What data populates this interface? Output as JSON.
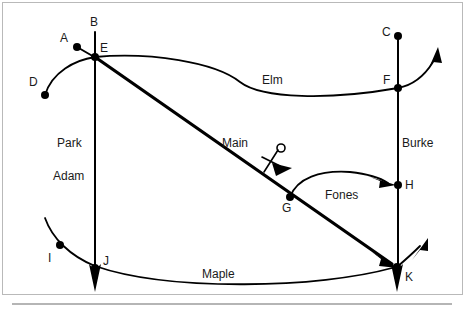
{
  "diagram": {
    "type": "street-intersection-map",
    "width": 465,
    "height": 322,
    "background_color": "#ffffff",
    "line_color": "#000000",
    "frame_color": "#b9b9b9",
    "baseline_color": "#6d6d6d"
  },
  "nodes": [
    {
      "id": "A",
      "label": "A",
      "x": 77,
      "y": 47,
      "label_x": 60,
      "label_y": 42,
      "has_dot": true
    },
    {
      "id": "B",
      "label": "B",
      "x": 95,
      "y": 28,
      "label_x": 90,
      "label_y": 26,
      "has_dot": false
    },
    {
      "id": "C",
      "label": "C",
      "x": 398,
      "y": 36,
      "label_x": 382,
      "label_y": 36,
      "has_dot": true
    },
    {
      "id": "D",
      "label": "D",
      "x": 45,
      "y": 95,
      "label_x": 29,
      "label_y": 86,
      "has_dot": true
    },
    {
      "id": "E",
      "label": "E",
      "x": 95,
      "y": 57,
      "label_x": 100,
      "label_y": 52,
      "has_dot": true
    },
    {
      "id": "F",
      "label": "F",
      "x": 398,
      "y": 88,
      "label_x": 383,
      "label_y": 84,
      "has_dot": true
    },
    {
      "id": "G",
      "label": "G",
      "x": 290,
      "y": 197,
      "label_x": 282,
      "label_y": 212,
      "has_dot": true
    },
    {
      "id": "H",
      "label": "H",
      "x": 398,
      "y": 185,
      "label_x": 405,
      "label_y": 185,
      "has_dot": true
    },
    {
      "id": "I",
      "label": "I",
      "x": 60,
      "y": 245,
      "label_x": 48,
      "label_y": 260,
      "has_dot": true
    },
    {
      "id": "J",
      "label": "J",
      "x": 95,
      "y": 268,
      "label_x": 103,
      "label_y": 265,
      "has_dot": true
    },
    {
      "id": "K",
      "label": "K",
      "x": 397,
      "y": 267,
      "label_x": 405,
      "label_y": 279,
      "has_dot": true
    }
  ],
  "streets": [
    {
      "name": "Park",
      "label": "Park",
      "label_x": 57,
      "label_y": 147
    },
    {
      "name": "Adam",
      "label": "Adam",
      "label_x": 53,
      "label_y": 180
    },
    {
      "name": "Elm",
      "label": "Elm",
      "label_x": 262,
      "label_y": 84
    },
    {
      "name": "Main",
      "label": "Main",
      "label_x": 222,
      "label_y": 147
    },
    {
      "name": "Burke",
      "label": "Burke",
      "label_x": 402,
      "label_y": 147
    },
    {
      "name": "Fones",
      "label": "Fones",
      "label_x": 325,
      "label_y": 199
    },
    {
      "name": "Maple",
      "label": "Maple",
      "label_x": 202,
      "label_y": 278
    }
  ],
  "annotation": {
    "name": "direction-marker",
    "description": "angle tick with small circle and solid triangle near Main",
    "symbol": "rho-with-arrow",
    "x": 272,
    "y": 158
  }
}
